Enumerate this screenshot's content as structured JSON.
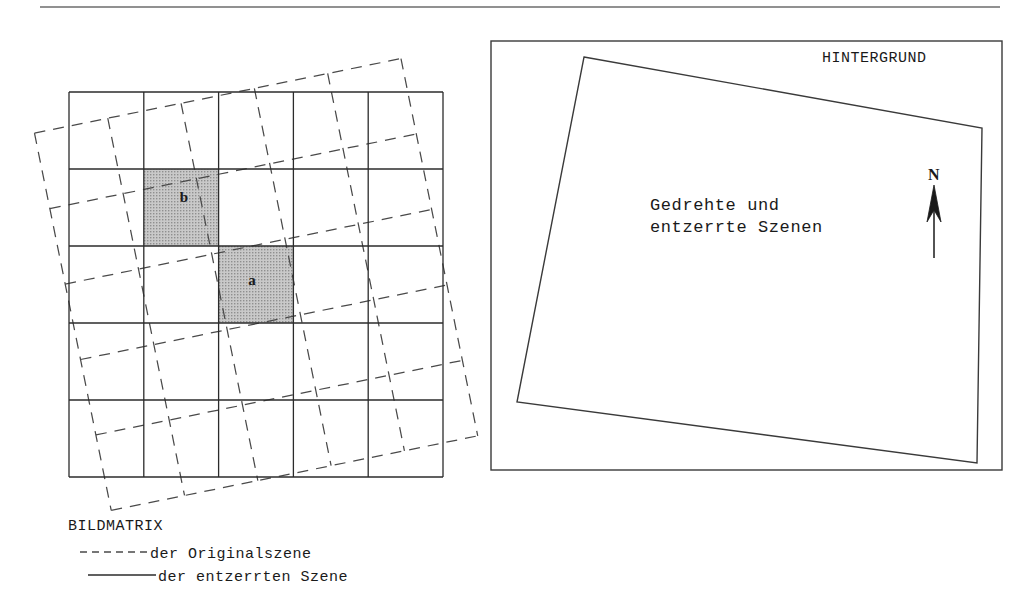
{
  "figure": {
    "top_rule": {
      "visible": true,
      "x1": 40,
      "x2": 1000,
      "y": 7
    }
  },
  "left_panel": {
    "name": "bildmatrix-panel",
    "solid_grid": {
      "description": "rectified scene image matrix",
      "rows": 5,
      "cols": 5,
      "x": 69,
      "y": 92,
      "width": 374,
      "height": 385,
      "line_style": "solid"
    },
    "dashed_grid": {
      "description": "original scene image matrix",
      "rows": 5,
      "cols": 5,
      "x": 69,
      "y": 92,
      "width": 374,
      "height": 385,
      "rotation_deg": -11.5,
      "pivot_x": 256,
      "pivot_y": 284,
      "line_style": "dashed"
    },
    "shaded_cells": [
      {
        "label": "b",
        "col": 1,
        "row": 1,
        "fill": "#b3b3b3"
      },
      {
        "label": "a",
        "col": 2,
        "row": 2,
        "fill": "#b3b3b3"
      }
    ],
    "legend": {
      "title": "BILDMATRIX",
      "entries": [
        {
          "style": "dashed",
          "label": "der Originalszene"
        },
        {
          "style": "solid",
          "label": "der entzerrten Szene"
        }
      ]
    }
  },
  "right_panel": {
    "name": "hintergrund-panel",
    "title": "HINTERGRUND",
    "frame": {
      "x": 491,
      "y": 41,
      "width": 511,
      "height": 429
    },
    "quadrilateral": {
      "description": "rotated and rectified scenes outline",
      "points": [
        {
          "x": 584,
          "y": 57
        },
        {
          "x": 982,
          "y": 128
        },
        {
          "x": 977,
          "y": 463
        },
        {
          "x": 517,
          "y": 402
        }
      ]
    },
    "caption": {
      "line1": "Gedrehte und",
      "line2": "entzerrte Szenen",
      "x": 650,
      "y": 210
    },
    "north_indicator": {
      "label": "N",
      "x": 934,
      "y": 175,
      "arrow_top_y": 185,
      "arrow_bottom_y": 258
    }
  },
  "colors": {
    "ink": "#1a1a1a",
    "line": "#2b2b2b",
    "dash": "#4a4a4a",
    "shade": "#b3b3b3",
    "rule": "#6d6d6d",
    "background": "#ffffff"
  }
}
